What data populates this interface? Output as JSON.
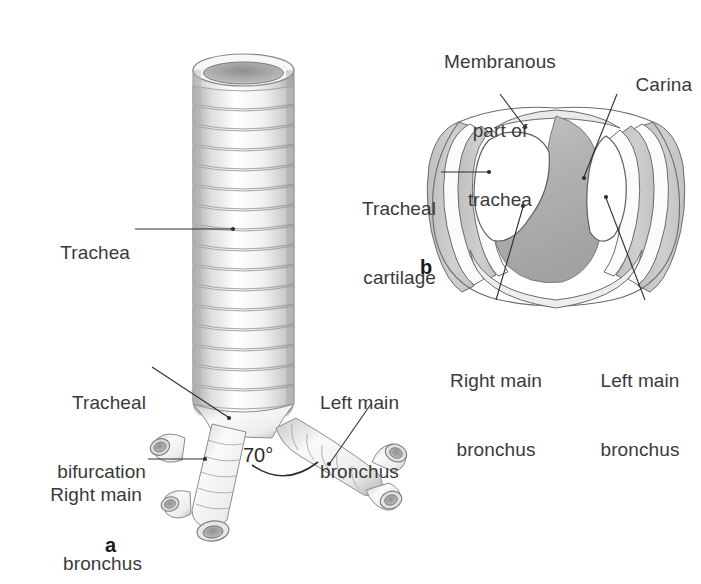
{
  "figure": {
    "background_color": "#ffffff",
    "text_color": "#3a3a3a",
    "leader_color": "#2e2e2e",
    "cartilage_color": "#c6c6c6",
    "carina_color": "#b2b2b2",
    "tube_color": "#efefef",
    "outline_color": "#555555"
  },
  "panel_a": {
    "letter": "a",
    "labels": {
      "trachea": "Trachea",
      "tracheal_bifurcation_line1": "Tracheal",
      "tracheal_bifurcation_line2": "bifurcation",
      "right_main_bronchus_line1": "Right main",
      "right_main_bronchus_line2": "bronchus",
      "left_main_bronchus_line1": "Left main",
      "left_main_bronchus_line2": "bronchus",
      "angle": "70°"
    }
  },
  "panel_b": {
    "letter": "b",
    "labels": {
      "membranous_line1": "Membranous",
      "membranous_line2": "part of",
      "membranous_line3": "trachea",
      "carina": "Carina",
      "tracheal_cartilage_line1": "Tracheal",
      "tracheal_cartilage_line2": "cartilage",
      "right_main_bronchus_line1": "Right main",
      "right_main_bronchus_line2": "bronchus",
      "left_main_bronchus_line1": "Left main",
      "left_main_bronchus_line2": "bronchus"
    }
  }
}
